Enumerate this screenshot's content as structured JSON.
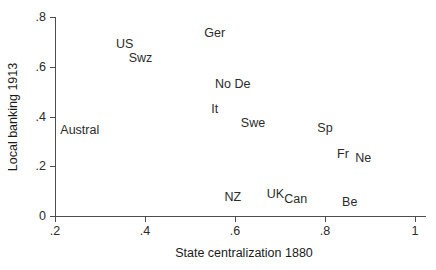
{
  "chart_data": {
    "type": "scatter",
    "title": "",
    "xlabel": "State centralization 1880",
    "ylabel": "Local banking 1913",
    "xlim": [
      0.2,
      1.0
    ],
    "ylim": [
      0.0,
      0.8
    ],
    "xticks": [
      ".2",
      ".4",
      ".6",
      ".8",
      "1"
    ],
    "xtick_values": [
      0.2,
      0.4,
      0.6,
      0.8,
      1.0
    ],
    "yticks": [
      "0",
      ".2",
      ".4",
      ".6",
      ".8"
    ],
    "ytick_values": [
      0.0,
      0.2,
      0.4,
      0.6,
      0.8
    ],
    "grid": false,
    "legend": "none",
    "marker_style": "text-label-only",
    "points": [
      {
        "label": "Ger",
        "x": 0.555,
        "y": 0.735
      },
      {
        "label": "US",
        "x": 0.355,
        "y": 0.69
      },
      {
        "label": "Swz",
        "x": 0.39,
        "y": 0.635
      },
      {
        "label": "No De",
        "x": 0.595,
        "y": 0.53
      },
      {
        "label": "It",
        "x": 0.555,
        "y": 0.43
      },
      {
        "label": "Swe",
        "x": 0.64,
        "y": 0.375
      },
      {
        "label": "Austral",
        "x": 0.255,
        "y": 0.345
      },
      {
        "label": "Sp",
        "x": 0.8,
        "y": 0.355
      },
      {
        "label": "Fr",
        "x": 0.84,
        "y": 0.25
      },
      {
        "label": "Ne",
        "x": 0.885,
        "y": 0.235
      },
      {
        "label": "UK",
        "x": 0.69,
        "y": 0.09
      },
      {
        "label": "Can",
        "x": 0.735,
        "y": 0.07
      },
      {
        "label": "NZ",
        "x": 0.595,
        "y": 0.075
      },
      {
        "label": "Be",
        "x": 0.855,
        "y": 0.055
      }
    ]
  },
  "colors": {
    "axis": "#4d4d4d",
    "text": "#2b2b2b",
    "title_text": "#1a1a1a",
    "background": "#ffffff"
  }
}
